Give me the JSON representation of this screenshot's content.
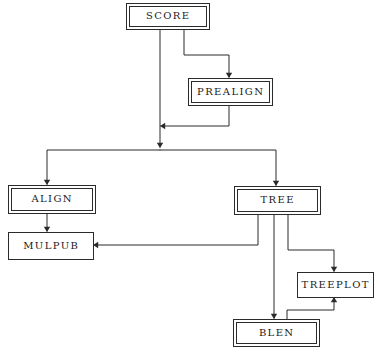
{
  "diagram": {
    "type": "flowchart",
    "canvas": {
      "width": 381,
      "height": 352
    },
    "colors": {
      "background": "#ffffff",
      "line": "#2b2b2b",
      "text": "#1a1a1a",
      "box_fill": "#ffffff"
    },
    "nodes": [
      {
        "id": "score",
        "label": "SCORE",
        "border": "double",
        "x": 126,
        "y": 3,
        "width": 83,
        "height": 26
      },
      {
        "id": "prealign",
        "label": "PREALIGN",
        "border": "double",
        "x": 188,
        "y": 78,
        "width": 84,
        "height": 27
      },
      {
        "id": "align",
        "label": "ALIGN",
        "border": "double",
        "x": 8,
        "y": 185,
        "width": 87,
        "height": 28
      },
      {
        "id": "mulpub",
        "label": "MULPUB",
        "border": "single",
        "x": 8,
        "y": 232,
        "width": 85,
        "height": 27
      },
      {
        "id": "tree",
        "label": "TREE",
        "border": "double",
        "x": 234,
        "y": 186,
        "width": 86,
        "height": 28
      },
      {
        "id": "treeplot",
        "label": "TREEPLOT",
        "border": "single",
        "x": 297,
        "y": 272,
        "width": 76,
        "height": 25
      },
      {
        "id": "blen",
        "label": "BLEN",
        "border": "double",
        "x": 233,
        "y": 319,
        "width": 86,
        "height": 27
      }
    ],
    "edges": [
      {
        "id": "score-to-split",
        "from": "score",
        "to": "split-bar",
        "points": "160,29 160,147",
        "arrow": {
          "x": 160,
          "y": 148,
          "dir": "down"
        }
      },
      {
        "id": "score-to-prealign",
        "from": "score",
        "to": "prealign",
        "points": "184,29 184,55 229,55 229,77",
        "arrow": {
          "x": 229,
          "y": 78,
          "dir": "down"
        }
      },
      {
        "id": "prealign-to-main",
        "from": "prealign",
        "to": "score-main-line",
        "points": "229,105 229,126 161,126",
        "arrow": {
          "x": 160,
          "y": 126,
          "dir": "left"
        }
      },
      {
        "id": "split-bar-to-align",
        "from": "split-bar",
        "to": "align",
        "points": "160,150 47,150 47,184",
        "arrow": {
          "x": 47,
          "y": 185,
          "dir": "down"
        }
      },
      {
        "id": "split-bar-to-tree",
        "from": "split-bar",
        "to": "tree",
        "points": "160,150 276,150 276,185",
        "arrow": {
          "x": 276,
          "y": 186,
          "dir": "down"
        }
      },
      {
        "id": "align-to-mulpub",
        "from": "align",
        "to": "mulpub",
        "points": "47,213 47,231",
        "arrow": {
          "x": 47,
          "y": 232,
          "dir": "down"
        }
      },
      {
        "id": "tree-to-mulpub",
        "from": "tree",
        "to": "mulpub",
        "points": "258,214 258,245 94,245",
        "arrow": {
          "x": 93,
          "y": 245,
          "dir": "left"
        }
      },
      {
        "id": "tree-to-blen",
        "from": "tree",
        "to": "blen",
        "points": "274,214 274,318",
        "arrow": {
          "x": 274,
          "y": 319,
          "dir": "down"
        }
      },
      {
        "id": "tree-to-treeplot",
        "from": "tree",
        "to": "treeplot",
        "points": "288,214 288,250 334,250 334,271",
        "arrow": {
          "x": 334,
          "y": 272,
          "dir": "down"
        }
      },
      {
        "id": "blen-to-treeplot",
        "from": "blen",
        "to": "treeplot",
        "points": "287,319 287,310 334,310 334,298",
        "arrow": {
          "x": 334,
          "y": 297,
          "dir": "up"
        }
      }
    ]
  }
}
